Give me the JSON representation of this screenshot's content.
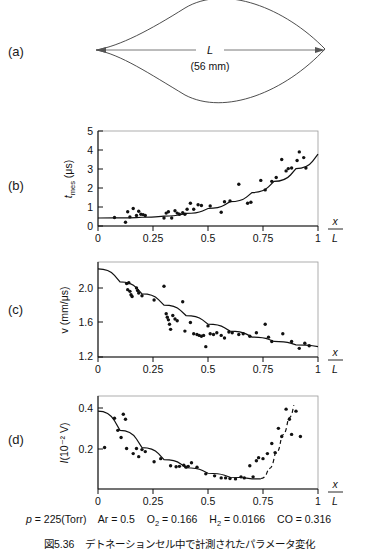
{
  "figure": {
    "panel_labels": {
      "a": "(a)",
      "b": "(b)",
      "c": "(c)",
      "d": "(d)"
    },
    "caption_number": "図5.36",
    "caption_text": "デトネーションセル中で計測されたパラメータ変化",
    "conditions": {
      "pressure_symbol": "p",
      "pressure_value": "225(Torr)",
      "species": [
        {
          "name": "Ar",
          "value": "0.5"
        },
        {
          "name": "O",
          "sub": "2",
          "value": "0.166"
        },
        {
          "name": "H",
          "sub": "2",
          "value": "0.0166"
        },
        {
          "name": "CO",
          "value": "0.316"
        }
      ],
      "full_text": "p = 225(Torr)  Ar = 0.5   O2 = 0.166   H2 = 0.0166   CO = 0.316"
    }
  },
  "schematic": {
    "title": "detonation cell",
    "length_label": "L",
    "length_value": "(56 mm)",
    "cell_length_mm": 56
  },
  "chart_data": [
    {
      "id": "panel-b",
      "type": "scatter",
      "title": "",
      "xlabel": "x/L",
      "ylabel": "t_mes (μs)",
      "ylabel_main": "t",
      "ylabel_sub": "mes",
      "ylabel_unit": "(μs)",
      "xlim": [
        0,
        1
      ],
      "ylim": [
        0,
        5
      ],
      "xticks": [
        0,
        0.25,
        0.5,
        0.75,
        1
      ],
      "xticklabels": [
        "0",
        "0.25",
        "0.5",
        "0.75",
        "1"
      ],
      "yticks": [
        0,
        1,
        2,
        3,
        4,
        5
      ],
      "yticklabels": [
        "0",
        "1",
        "2",
        "3",
        "4",
        "5"
      ],
      "grid": false,
      "legend": "none",
      "points": [
        [
          0.075,
          0.45
        ],
        [
          0.125,
          0.2
        ],
        [
          0.135,
          0.75
        ],
        [
          0.145,
          0.48
        ],
        [
          0.16,
          0.92
        ],
        [
          0.175,
          0.55
        ],
        [
          0.185,
          0.78
        ],
        [
          0.195,
          0.62
        ],
        [
          0.205,
          0.6
        ],
        [
          0.215,
          0.55
        ],
        [
          0.3,
          0.42
        ],
        [
          0.31,
          0.68
        ],
        [
          0.32,
          0.75
        ],
        [
          0.335,
          0.42
        ],
        [
          0.35,
          0.8
        ],
        [
          0.36,
          0.68
        ],
        [
          0.37,
          0.62
        ],
        [
          0.385,
          0.7
        ],
        [
          0.395,
          0.62
        ],
        [
          0.405,
          0.88
        ],
        [
          0.42,
          1.2
        ],
        [
          0.435,
          0.88
        ],
        [
          0.455,
          1.12
        ],
        [
          0.47,
          1.08
        ],
        [
          0.51,
          1.05
        ],
        [
          0.56,
          0.72
        ],
        [
          0.575,
          1.28
        ],
        [
          0.6,
          1.32
        ],
        [
          0.64,
          2.2
        ],
        [
          0.68,
          1.2
        ],
        [
          0.695,
          1.25
        ],
        [
          0.74,
          2.4
        ],
        [
          0.76,
          1.9
        ],
        [
          0.79,
          2.35
        ],
        [
          0.81,
          2.55
        ],
        [
          0.835,
          3.5
        ],
        [
          0.855,
          2.9
        ],
        [
          0.865,
          3.02
        ],
        [
          0.88,
          3.05
        ],
        [
          0.905,
          3.45
        ],
        [
          0.915,
          3.9
        ],
        [
          0.935,
          3.6
        ],
        [
          0.945,
          3.05
        ]
      ],
      "fit_curve": {
        "style": "solid",
        "points": [
          [
            0.0,
            0.42
          ],
          [
            0.1,
            0.43
          ],
          [
            0.2,
            0.46
          ],
          [
            0.3,
            0.52
          ],
          [
            0.4,
            0.66
          ],
          [
            0.5,
            0.92
          ],
          [
            0.6,
            1.28
          ],
          [
            0.7,
            1.76
          ],
          [
            0.8,
            2.35
          ],
          [
            0.9,
            3.02
          ],
          [
            1.0,
            3.78
          ]
        ]
      }
    },
    {
      "id": "panel-c",
      "type": "scatter",
      "title": "",
      "xlabel": "x/L",
      "ylabel": "v (mm/μs)",
      "xlim": [
        0,
        1
      ],
      "ylim": [
        1.2,
        2.3
      ],
      "xticks": [
        0,
        0.25,
        0.5,
        0.75,
        1
      ],
      "xticklabels": [
        "0",
        "0.25",
        "0.5",
        "0.75",
        "1"
      ],
      "yticks": [
        1.2,
        1.6,
        2.0
      ],
      "yticklabels": [
        "1.2",
        "1.6",
        "2.0"
      ],
      "grid": false,
      "legend": "none",
      "points": [
        [
          0.13,
          2.05
        ],
        [
          0.14,
          2.06
        ],
        [
          0.135,
          1.98
        ],
        [
          0.145,
          1.96
        ],
        [
          0.15,
          1.92
        ],
        [
          0.155,
          1.9
        ],
        [
          0.175,
          2.0
        ],
        [
          0.18,
          1.97
        ],
        [
          0.185,
          1.94
        ],
        [
          0.2,
          1.91
        ],
        [
          0.255,
          1.86
        ],
        [
          0.3,
          2.02
        ],
        [
          0.31,
          1.7
        ],
        [
          0.315,
          1.66
        ],
        [
          0.32,
          1.63
        ],
        [
          0.325,
          1.58
        ],
        [
          0.33,
          1.52
        ],
        [
          0.34,
          1.68
        ],
        [
          0.35,
          1.64
        ],
        [
          0.36,
          1.62
        ],
        [
          0.385,
          1.84
        ],
        [
          0.395,
          1.5
        ],
        [
          0.42,
          1.6
        ],
        [
          0.435,
          1.47
        ],
        [
          0.45,
          1.46
        ],
        [
          0.46,
          1.45
        ],
        [
          0.47,
          1.44
        ],
        [
          0.48,
          1.45
        ],
        [
          0.49,
          1.32
        ],
        [
          0.5,
          1.56
        ],
        [
          0.51,
          1.47
        ],
        [
          0.525,
          1.46
        ],
        [
          0.54,
          1.48
        ],
        [
          0.56,
          1.45
        ],
        [
          0.575,
          1.42
        ],
        [
          0.595,
          1.49
        ],
        [
          0.61,
          1.48
        ],
        [
          0.64,
          1.46
        ],
        [
          0.66,
          1.47
        ],
        [
          0.69,
          1.44
        ],
        [
          0.72,
          1.48
        ],
        [
          0.76,
          1.58
        ],
        [
          0.775,
          1.43
        ],
        [
          0.79,
          1.38
        ],
        [
          0.84,
          1.47
        ],
        [
          0.88,
          1.38
        ],
        [
          0.915,
          1.3
        ],
        [
          0.94,
          1.36
        ],
        [
          0.96,
          1.33
        ]
      ],
      "fit_curve": {
        "style": "solid",
        "points": [
          [
            0.0,
            2.22
          ],
          [
            0.1,
            2.07
          ],
          [
            0.2,
            1.93
          ],
          [
            0.3,
            1.8
          ],
          [
            0.4,
            1.68
          ],
          [
            0.5,
            1.58
          ],
          [
            0.6,
            1.5
          ],
          [
            0.7,
            1.43
          ],
          [
            0.8,
            1.38
          ],
          [
            0.9,
            1.34
          ],
          [
            1.0,
            1.32
          ]
        ]
      }
    },
    {
      "id": "panel-d",
      "type": "scatter",
      "title": "",
      "xlabel": "x/L",
      "ylabel": "I(10⁻² V)",
      "ylabel_main": "I",
      "ylabel_unit": "(10⁻² V)",
      "xlim": [
        0,
        1
      ],
      "ylim": [
        0,
        0.46
      ],
      "xticks": [
        0,
        0.25,
        0.5,
        0.75,
        1
      ],
      "xticklabels": [
        "0",
        "0.25",
        "0.5",
        "0.75",
        "1"
      ],
      "yticks": [
        0.2,
        0.4
      ],
      "yticklabels": [
        "0.2",
        "0.4"
      ],
      "grid": false,
      "legend": "none",
      "points": [
        [
          0.03,
          0.205
        ],
        [
          0.075,
          0.35
        ],
        [
          0.09,
          0.29
        ],
        [
          0.105,
          0.255
        ],
        [
          0.115,
          0.37
        ],
        [
          0.125,
          0.345
        ],
        [
          0.13,
          0.2
        ],
        [
          0.16,
          0.175
        ],
        [
          0.175,
          0.2
        ],
        [
          0.185,
          0.16
        ],
        [
          0.2,
          0.195
        ],
        [
          0.215,
          0.185
        ],
        [
          0.255,
          0.135
        ],
        [
          0.285,
          0.15
        ],
        [
          0.33,
          0.115
        ],
        [
          0.355,
          0.11
        ],
        [
          0.37,
          0.112
        ],
        [
          0.39,
          0.118
        ],
        [
          0.4,
          0.108
        ],
        [
          0.41,
          0.112
        ],
        [
          0.425,
          0.13
        ],
        [
          0.45,
          0.108
        ],
        [
          0.49,
          0.075
        ],
        [
          0.53,
          0.065
        ],
        [
          0.56,
          0.055
        ],
        [
          0.58,
          0.055
        ],
        [
          0.6,
          0.052
        ],
        [
          0.625,
          0.05
        ],
        [
          0.65,
          0.06
        ],
        [
          0.665,
          0.055
        ],
        [
          0.69,
          0.115
        ],
        [
          0.705,
          0.06
        ],
        [
          0.72,
          0.14
        ],
        [
          0.73,
          0.155
        ],
        [
          0.75,
          0.15
        ],
        [
          0.77,
          0.175
        ],
        [
          0.79,
          0.225
        ],
        [
          0.805,
          0.18
        ],
        [
          0.82,
          0.3
        ],
        [
          0.835,
          0.26
        ],
        [
          0.855,
          0.395
        ],
        [
          0.87,
          0.345
        ],
        [
          0.88,
          0.27
        ],
        [
          0.9,
          0.385
        ],
        [
          0.92,
          0.26
        ]
      ],
      "fit_curve": {
        "style": "solid",
        "points": [
          [
            0.0,
            0.385
          ],
          [
            0.1,
            0.29
          ],
          [
            0.2,
            0.205
          ],
          [
            0.3,
            0.145
          ],
          [
            0.4,
            0.105
          ],
          [
            0.5,
            0.078
          ],
          [
            0.6,
            0.058
          ],
          [
            0.7,
            0.05
          ],
          [
            0.74,
            0.05
          ]
        ]
      },
      "extrapolation_curve": {
        "style": "dashed",
        "points": [
          [
            0.74,
            0.052
          ],
          [
            0.775,
            0.1
          ],
          [
            0.805,
            0.175
          ],
          [
            0.835,
            0.265
          ],
          [
            0.865,
            0.35
          ],
          [
            0.89,
            0.415
          ]
        ]
      }
    }
  ]
}
